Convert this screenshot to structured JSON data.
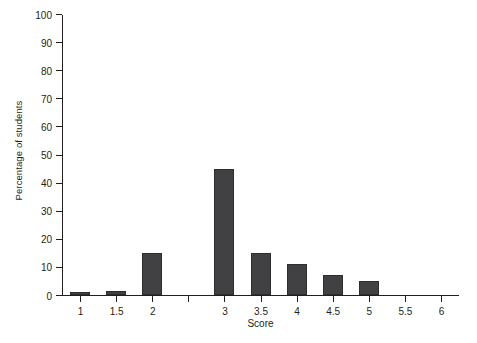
{
  "chart_data": {
    "type": "bar",
    "title": "",
    "xlabel": "Score",
    "ylabel": "Percentage of students",
    "categories": [
      "1",
      "1.5",
      "2",
      "",
      "3",
      "3.5",
      "4",
      "4.5",
      "5",
      "5.5",
      "6"
    ],
    "values": [
      1,
      1.5,
      15,
      0,
      45,
      15,
      11,
      7,
      5,
      0,
      0
    ],
    "xlim": [
      1,
      6
    ],
    "ylim": [
      0,
      100
    ],
    "ytick_labels": [
      "0",
      "10",
      "20",
      "30",
      "40",
      "50",
      "60",
      "70",
      "80",
      "90",
      "100"
    ],
    "ytick_values": [
      0,
      10,
      20,
      30,
      40,
      50,
      60,
      70,
      80,
      90,
      100
    ],
    "xtick_labels": [
      "1",
      "1.5",
      "2",
      "",
      "3",
      "3.5",
      "4",
      "4.5",
      "5",
      "5.5",
      "6"
    ],
    "grid": false,
    "legend": false,
    "bar_color": "#414042",
    "bar_edge_color": "#2f2d30",
    "axis_color": "#231f20",
    "background": "#ffffff"
  }
}
